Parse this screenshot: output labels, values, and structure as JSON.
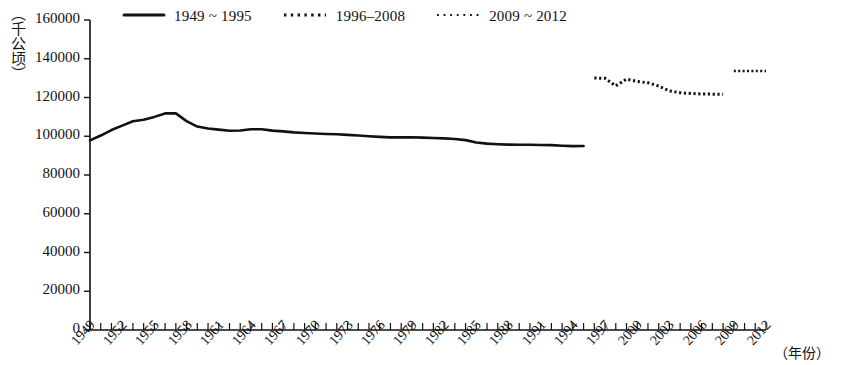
{
  "chart_data": {
    "type": "line",
    "title": "",
    "subtitle": "",
    "xlabel": "（年份）",
    "ylabel": "（千公顷）",
    "xlim": [
      1949,
      2012
    ],
    "ylim": [
      0,
      160000
    ],
    "grid": false,
    "legend_position": "top-left",
    "y_ticks": [
      0,
      20000,
      40000,
      60000,
      80000,
      100000,
      120000,
      140000,
      160000
    ],
    "y_tick_labels": [
      "0",
      "20000",
      "40000",
      "60000",
      "80000",
      "100000",
      "120000",
      "140000",
      "160000"
    ],
    "x_ticks_all_years": [
      1949,
      1950,
      1951,
      1952,
      1953,
      1954,
      1955,
      1956,
      1957,
      1958,
      1959,
      1960,
      1961,
      1962,
      1963,
      1964,
      1965,
      1966,
      1967,
      1968,
      1969,
      1970,
      1971,
      1972,
      1973,
      1974,
      1975,
      1976,
      1977,
      1978,
      1979,
      1980,
      1981,
      1982,
      1983,
      1984,
      1985,
      1986,
      1987,
      1988,
      1989,
      1990,
      1991,
      1992,
      1993,
      1994,
      1995,
      1996,
      1997,
      1998,
      1999,
      2000,
      2001,
      2002,
      2003,
      2004,
      2005,
      2006,
      2007,
      2008,
      2009,
      2010,
      2011,
      2012
    ],
    "x_tick_labels": [
      "1949",
      "1952",
      "1955",
      "1958",
      "1961",
      "1964",
      "1967",
      "1970",
      "1973",
      "1976",
      "1979",
      "1982",
      "1985",
      "1988",
      "1991",
      "1994",
      "1997",
      "2000",
      "2003",
      "2006",
      "2009",
      "2012"
    ],
    "x_tick_label_years": [
      1949,
      1952,
      1955,
      1958,
      1961,
      1964,
      1967,
      1970,
      1973,
      1976,
      1979,
      1982,
      1985,
      1988,
      1991,
      1994,
      1997,
      2000,
      2003,
      2006,
      2009,
      2012
    ],
    "series": [
      {
        "name": "1949 ~ 1995",
        "style": "solid",
        "color": "#111111",
        "x": [
          1949,
          1950,
          1951,
          1952,
          1953,
          1954,
          1955,
          1956,
          1957,
          1958,
          1959,
          1960,
          1961,
          1962,
          1963,
          1964,
          1965,
          1966,
          1967,
          1968,
          1969,
          1970,
          1971,
          1972,
          1973,
          1974,
          1975,
          1976,
          1977,
          1978,
          1979,
          1980,
          1981,
          1982,
          1983,
          1984,
          1985,
          1986,
          1987,
          1988,
          1989,
          1990,
          1991,
          1992,
          1993,
          1994,
          1995
        ],
        "values": [
          97881,
          100360,
          103200,
          105500,
          107700,
          108500,
          110000,
          111800,
          111800,
          107800,
          105000,
          104000,
          103400,
          102800,
          103000,
          103600,
          103600,
          102900,
          102500,
          102000,
          101700,
          101400,
          101200,
          101000,
          100700,
          100400,
          100000,
          99700,
          99400,
          99400,
          99500,
          99300,
          99100,
          98900,
          98600,
          98000,
          96800,
          96200,
          95900,
          95700,
          95600,
          95600,
          95500,
          95400,
          95100,
          94900,
          94970
        ]
      },
      {
        "name": "1996–2008",
        "style": "dotted",
        "color": "#111111",
        "x": [
          1996,
          1997,
          1998,
          1999,
          2000,
          2001,
          2002,
          2003,
          2004,
          2005,
          2006,
          2007,
          2008
        ],
        "values": [
          130039,
          129903,
          126000,
          129500,
          128243,
          127615,
          125930,
          123393,
          122444,
          122083,
          121776,
          121736,
          121716
        ]
      },
      {
        "name": "2009 ~ 2012",
        "style": "dotted-fine",
        "color": "#111111",
        "x": [
          2009,
          2010,
          2011,
          2012
        ],
        "values": [
          133700,
          133700,
          133700,
          133700
        ]
      }
    ]
  },
  "legend": {
    "items": [
      {
        "label": "1949 ~ 1995",
        "style": "solid"
      },
      {
        "label": "1996–2008",
        "style": "dotted"
      },
      {
        "label": "2009 ~ 2012",
        "style": "dotted-fine"
      }
    ]
  },
  "axes": {
    "y_unit_label": "（千公顷）",
    "x_unit_label": "（年份）"
  }
}
